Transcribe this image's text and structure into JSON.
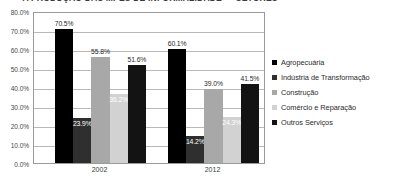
{
  "chart_data": {
    "type": "bar",
    "title": "A PRODUÇÃO DAS MPES DE INFORMALIDADE — SETORES",
    "xlabel": "",
    "ylabel": "",
    "categories": [
      "2002",
      "2012"
    ],
    "ylim": [
      0,
      80
    ],
    "ytick_step": 10,
    "ytick_labels": [
      "0.0%",
      "10.0%",
      "20.0%",
      "30.0%",
      "40.0%",
      "50.0%",
      "60.0%",
      "70.0%",
      "80.0%"
    ],
    "ytick_values": [
      0,
      10,
      20,
      30,
      40,
      50,
      60,
      70,
      80
    ],
    "grid": true,
    "legend_position": "right",
    "series": [
      {
        "name": "Agropecuária",
        "color": "#000000",
        "values": [
          70.5,
          60.1
        ],
        "labels": [
          "70.5%",
          "60.1%"
        ],
        "label_placement": [
          "outside",
          "outside"
        ]
      },
      {
        "name": "Indústria de Transformação",
        "color": "#2f2f2f",
        "values": [
          23.9,
          14.2
        ],
        "labels": [
          "23.9%",
          "14.2%"
        ],
        "label_placement": [
          "inside",
          "inside"
        ]
      },
      {
        "name": "Construção",
        "color": "#a8a8a8",
        "values": [
          55.8,
          39.0
        ],
        "labels": [
          "55.8%",
          "39.0%"
        ],
        "label_placement": [
          "outside",
          "outside"
        ]
      },
      {
        "name": "Comércio e Reparação",
        "color": "#d2d2d2",
        "values": [
          36.2,
          24.3
        ],
        "labels": [
          "36.2%",
          "24.3%"
        ],
        "label_placement": [
          "inside",
          "inside"
        ]
      },
      {
        "name": "Outros Serviços",
        "color": "#131313",
        "values": [
          51.6,
          41.5
        ],
        "labels": [
          "51.6%",
          "41.5%"
        ],
        "label_placement": [
          "outside",
          "outside"
        ]
      }
    ]
  }
}
